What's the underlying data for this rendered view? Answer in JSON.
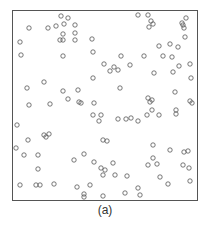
{
  "figure": {
    "caption": "(a)"
  },
  "style": {
    "frame_color": "#555555",
    "marker_color": "#555555",
    "background": "#ffffff"
  },
  "chart_data": {
    "type": "scatter",
    "title": "",
    "xlabel": "",
    "ylabel": "",
    "caption": "(a)",
    "grid": false,
    "legend": null,
    "axes_ticks": "none",
    "marker": "hollow-circle",
    "frame": {
      "x0": 12,
      "y0": 10,
      "x1": 197,
      "y1": 200
    },
    "coordinate_space": "image pixels (x right, y down)",
    "points": [
      [
        61,
        16
      ],
      [
        68,
        18
      ],
      [
        138,
        15
      ],
      [
        148,
        15
      ],
      [
        186,
        18
      ],
      [
        182,
        23
      ],
      [
        183,
        25
      ],
      [
        184,
        28
      ],
      [
        29,
        28
      ],
      [
        48,
        28
      ],
      [
        56,
        26
      ],
      [
        64,
        24
      ],
      [
        75,
        25
      ],
      [
        63,
        34
      ],
      [
        60,
        40
      ],
      [
        63,
        40
      ],
      [
        149,
        27
      ],
      [
        151,
        21
      ],
      [
        153,
        24
      ],
      [
        75,
        33
      ],
      [
        75,
        40
      ],
      [
        20,
        42
      ],
      [
        92,
        39
      ],
      [
        185,
        37
      ],
      [
        172,
        57
      ],
      [
        21,
        55
      ],
      [
        93,
        52
      ],
      [
        159,
        46
      ],
      [
        170,
        44
      ],
      [
        178,
        47
      ],
      [
        163,
        56
      ],
      [
        179,
        66
      ],
      [
        121,
        56
      ],
      [
        144,
        56
      ],
      [
        118,
        70
      ],
      [
        130,
        65
      ],
      [
        114,
        67
      ],
      [
        154,
        73
      ],
      [
        173,
        72
      ],
      [
        110,
        71
      ],
      [
        104,
        64
      ],
      [
        93,
        78
      ],
      [
        63,
        56
      ],
      [
        27,
        88
      ],
      [
        29,
        105
      ],
      [
        44,
        82
      ],
      [
        50,
        104
      ],
      [
        63,
        91
      ],
      [
        68,
        99
      ],
      [
        79,
        102
      ],
      [
        81,
        103
      ],
      [
        78,
        90
      ],
      [
        94,
        103
      ],
      [
        93,
        115
      ],
      [
        101,
        115
      ],
      [
        99,
        121
      ],
      [
        118,
        119
      ],
      [
        126,
        119
      ],
      [
        131,
        118
      ],
      [
        138,
        121
      ],
      [
        147,
        115
      ],
      [
        159,
        115
      ],
      [
        120,
        88
      ],
      [
        148,
        98
      ],
      [
        150,
        102
      ],
      [
        152,
        100
      ],
      [
        152,
        110
      ],
      [
        175,
        92
      ],
      [
        176,
        110
      ],
      [
        190,
        101
      ],
      [
        192,
        103
      ],
      [
        191,
        78
      ],
      [
        190,
        64
      ],
      [
        176,
        114
      ],
      [
        17,
        125
      ],
      [
        28,
        140
      ],
      [
        44,
        135
      ],
      [
        46,
        137
      ],
      [
        49,
        134
      ],
      [
        16,
        148
      ],
      [
        24,
        155
      ],
      [
        38,
        155
      ],
      [
        38,
        169
      ],
      [
        20,
        185
      ],
      [
        36,
        185
      ],
      [
        40,
        185
      ],
      [
        54,
        184
      ],
      [
        103,
        140
      ],
      [
        107,
        141
      ],
      [
        74,
        160
      ],
      [
        84,
        154
      ],
      [
        94,
        162
      ],
      [
        101,
        168
      ],
      [
        103,
        175
      ],
      [
        105,
        170
      ],
      [
        115,
        175
      ],
      [
        113,
        163
      ],
      [
        127,
        176
      ],
      [
        138,
        188
      ],
      [
        148,
        165
      ],
      [
        153,
        145
      ],
      [
        153,
        158
      ],
      [
        157,
        164
      ],
      [
        160,
        177
      ],
      [
        168,
        184
      ],
      [
        170,
        150
      ],
      [
        184,
        152
      ],
      [
        183,
        165
      ],
      [
        189,
        168
      ],
      [
        190,
        181
      ],
      [
        188,
        151
      ],
      [
        84,
        194
      ],
      [
        84,
        197
      ],
      [
        103,
        196
      ],
      [
        125,
        193
      ],
      [
        140,
        195
      ],
      [
        77,
        187
      ],
      [
        90,
        185
      ]
    ]
  }
}
